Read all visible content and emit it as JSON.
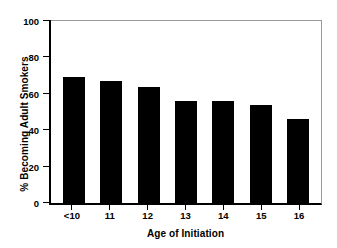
{
  "chart_data": {
    "type": "bar",
    "title": "",
    "xlabel": "Age of Initiation",
    "ylabel": "% Becoming Adult Smokers",
    "categories": [
      "<10",
      "11",
      "12",
      "13",
      "14",
      "15",
      "16"
    ],
    "values": [
      69,
      67,
      64,
      56,
      56,
      54,
      46
    ],
    "ylim": [
      0,
      100
    ],
    "yticks": [
      0,
      20,
      40,
      60,
      80,
      100
    ],
    "ytick_labels": [
      "0",
      "20",
      "40",
      "60",
      "80",
      "100"
    ],
    "grid": false,
    "legend": null,
    "bar_color": "#000000",
    "axis_color": "#000000",
    "frame_color": "#9a9a9a",
    "background_color": "#ffffff"
  }
}
